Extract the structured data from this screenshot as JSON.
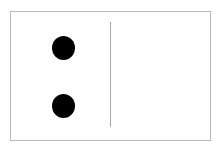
{
  "domino": {
    "left_value": 2,
    "right_value": 0,
    "orientation": "horizontal",
    "colors": {
      "background": "#ffffff",
      "border": "#b8b8b8",
      "divider": "#a8a8a8",
      "pip": "#000000"
    }
  }
}
